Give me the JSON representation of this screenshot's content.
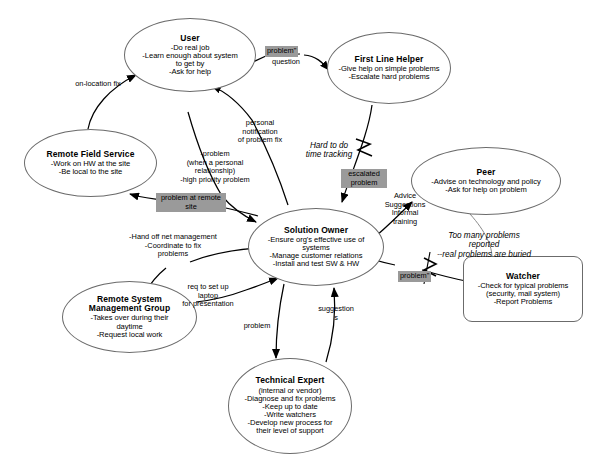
{
  "diagram": {
    "background_color": "#ffffff",
    "stroke_color": "#6b6b6b",
    "highlight_color": "#9a9a9a",
    "nodes": [
      {
        "id": "user",
        "shape": "ellipse",
        "title": "User",
        "lines": "-Do real job\n-Learn enough about system\nto get by\n-Ask for help"
      },
      {
        "id": "first-line-helper",
        "shape": "ellipse",
        "title": "First Line Helper",
        "lines": "-Give help on simple problems\n-Escalate hard problems"
      },
      {
        "id": "remote-field-service",
        "shape": "ellipse",
        "title": "Remote Field Service",
        "lines": "-Work on HW at the site\n-Be local to the site"
      },
      {
        "id": "peer",
        "shape": "ellipse",
        "title": "Peer",
        "lines": "-Advise on technology and policy\n-Ask for help on problem"
      },
      {
        "id": "solution-owner",
        "shape": "ellipse",
        "title": "Solution Owner",
        "lines": "-Ensure org's effective use of\nsystems\n-Manage customer relations\n-Install and test SW & HW"
      },
      {
        "id": "watcher",
        "shape": "rounded",
        "title": "Watcher",
        "lines": "-Check for typical problems\n(security, mail system)\n-Report Problems"
      },
      {
        "id": "remote-system-management-group",
        "shape": "ellipse",
        "title": "Remote System\nManagement Group",
        "lines": "-Takes over during their\ndaytime\n-Request local work"
      },
      {
        "id": "technical-expert",
        "shape": "ellipse",
        "title": "Technical Expert",
        "lines": "(internal or vendor)\n-Diagnose and fix problems\n-Keep up to date\n-Write watchers\n-Develop new process for\ntheir level of support"
      }
    ],
    "edge_labels": [
      {
        "id": "on-location-fix",
        "text": "on-location fix",
        "style": "plain"
      },
      {
        "id": "problem-question",
        "text": "problem\"\nquestion",
        "style": "plain-with-highlight-first-line"
      },
      {
        "id": "problem-question-hl",
        "text": "problem\"",
        "style": "highlight"
      },
      {
        "id": "problem-question-sub",
        "text": "question",
        "style": "plain"
      },
      {
        "id": "personal-notification",
        "text": "personal\nnotification\nof problem fix",
        "style": "plain"
      },
      {
        "id": "problem-personal-relationship",
        "text": "-problem\n(when a personal\nrelationship)\n-high priority problem",
        "style": "plain"
      },
      {
        "id": "hard-to-do-time-tracking",
        "text": "Hard to do\ntime tracking",
        "style": "italic"
      },
      {
        "id": "escalated-problem",
        "text": "escalated\nproblem",
        "style": "highlight"
      },
      {
        "id": "problem-at-remote-site",
        "text": "problem at remote\nsite",
        "style": "highlight"
      },
      {
        "id": "advice-suggestions-informal-training",
        "text": "Advice\nSuggestions\nInformal\ntraining",
        "style": "plain"
      },
      {
        "id": "too-many-problems",
        "text": "Too many problems\nreported\n--real problems are buried",
        "style": "italic"
      },
      {
        "id": "problem-watcher",
        "text": "problem\"",
        "style": "highlight"
      },
      {
        "id": "hand-off-net-management",
        "text": "-Hand off net management\n-Coordinate to fix\nproblems",
        "style": "plain"
      },
      {
        "id": "req-to-set-up-laptop",
        "text": "req to set up\nlaptop\nfor presentation",
        "style": "plain"
      },
      {
        "id": "problem-technical-expert",
        "text": "problem",
        "style": "plain"
      },
      {
        "id": "suggestions",
        "text": "suggestion\ns",
        "style": "plain"
      }
    ]
  }
}
